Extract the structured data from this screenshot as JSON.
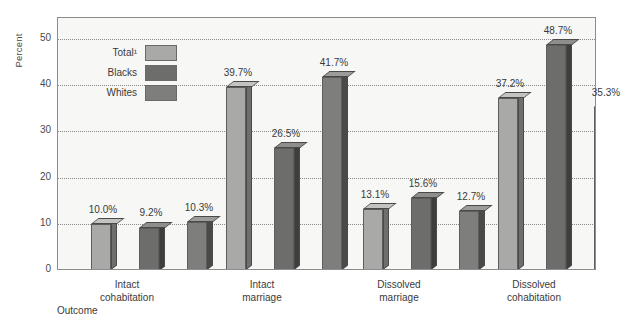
{
  "chart_data": {
    "type": "bar",
    "title": "",
    "subtitle": "",
    "xlabel": "Outcome",
    "ylabel": "Percent",
    "ylim": [
      0,
      55
    ],
    "yticks": [
      0,
      10,
      20,
      30,
      40,
      50
    ],
    "ytick_labels": [
      "0",
      "10",
      "20",
      "30",
      "40",
      "50"
    ],
    "grid": "horizontal-dotted",
    "legend_position": "inside-top-left",
    "categories": [
      "Intact\ncohabitation",
      "Intact\nmarriage",
      "Dissolved\nmarriage",
      "Dissolved\ncohabitation"
    ],
    "category_lines": [
      [
        "Intact",
        "cohabitation"
      ],
      [
        "Intact",
        "marriage"
      ],
      [
        "Dissolved",
        "marriage"
      ],
      [
        "Dissolved",
        "cohabitation"
      ]
    ],
    "series": [
      {
        "name": "Total¹",
        "color": "#a9a9a7",
        "side_color": "#6f6f6d",
        "top_color": "#c3c3c1",
        "values": [
          10.0,
          39.7,
          13.1,
          37.2
        ],
        "data_labels": [
          "10.0%",
          "39.7%",
          "13.1%",
          "37.2%"
        ]
      },
      {
        "name": "Blacks",
        "color": "#6d6d6b",
        "side_color": "#3e3e3c",
        "top_color": "#8e8e8c",
        "values": [
          9.2,
          26.5,
          15.6,
          48.7
        ],
        "data_labels": [
          "9.2%",
          "26.5%",
          "15.6%",
          "48.7%"
        ]
      },
      {
        "name": "Whites",
        "color": "#7e7e7c",
        "side_color": "#4a4a48",
        "top_color": "#9c9c9a",
        "values": [
          10.3,
          41.7,
          12.7,
          35.3
        ],
        "data_labels": [
          "10.3%",
          "41.7%",
          "12.7%",
          "35.3%"
        ]
      }
    ]
  },
  "legend": {
    "items": [
      {
        "label": "Total¹",
        "swatch": "#a9a9a7"
      },
      {
        "label": "Blacks",
        "swatch": "#6d6d6b"
      },
      {
        "label": "Whites",
        "swatch": "#7e7e7c"
      }
    ]
  }
}
